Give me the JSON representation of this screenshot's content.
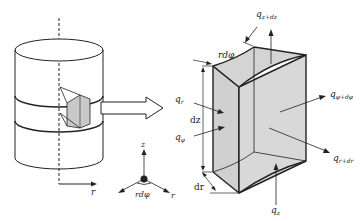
{
  "diagram": {
    "cylinder": {
      "axis_label": "r"
    },
    "coord_system": {
      "z_label": "z",
      "r_label": "r",
      "angle_label": "rdφ"
    },
    "element": {
      "top_label": "rdφ",
      "height_label": "dz",
      "depth_label": "dr",
      "fill_color": "#d4d4d4",
      "fluxes": {
        "q_r": {
          "base": "q",
          "sub": "r"
        },
        "q_phi": {
          "base": "q",
          "sub": "φ"
        },
        "q_z": {
          "base": "q",
          "sub": "z"
        },
        "q_z_dz": {
          "base": "q",
          "sub": "z+dz"
        },
        "q_phi_dphi": {
          "base": "q",
          "sub": "φ+dφ"
        },
        "q_r_dr": {
          "base": "q",
          "sub": "r+dr"
        }
      }
    }
  }
}
